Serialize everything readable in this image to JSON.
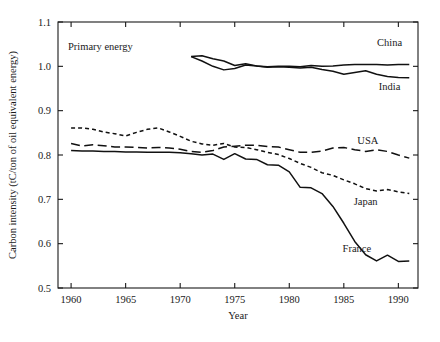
{
  "chart_data": {
    "type": "line",
    "title": "",
    "annotation": "Primary energy",
    "xlabel": "Year",
    "ylabel": "Carbon intensity (tC/ton of oil equivalent energy)",
    "xlim": [
      1958.8,
      1991.8
    ],
    "ylim": [
      0.5,
      1.1
    ],
    "xticks": [
      1960,
      1965,
      1970,
      1975,
      1980,
      1985,
      1990
    ],
    "xtick_labels": [
      "1960",
      "1965",
      "1970",
      "1975",
      "1980",
      "1985",
      "1990"
    ],
    "yticks": [
      0.5,
      0.6,
      0.7,
      0.8,
      0.9,
      1.0,
      1.1
    ],
    "ytick_labels": [
      "0.5",
      "0.6",
      "0.7",
      "0.8",
      "0.9",
      "1.0",
      "1.1"
    ],
    "grid": false,
    "legend_position": "inline-right-of-series",
    "line_color": "#111111",
    "series": [
      {
        "name": "China",
        "label": "China",
        "style": "solid",
        "dasharray": "",
        "label_x": 1989.2,
        "label_y": 1.046,
        "x": [
          1971,
          1972,
          1973,
          1974,
          1975,
          1976,
          1977,
          1978,
          1979,
          1980,
          1981,
          1982,
          1983,
          1984,
          1985,
          1986,
          1987,
          1988,
          1989,
          1990,
          1991
        ],
        "y": [
          1.022,
          1.024,
          1.017,
          1.012,
          1.002,
          1.006,
          1.001,
          0.999,
          1.0,
          1.0,
          0.999,
          1.002,
          1.0,
          1.001,
          1.003,
          1.004,
          1.004,
          1.004,
          1.003,
          1.004,
          1.004
        ]
      },
      {
        "name": "India",
        "label": "India",
        "style": "solid",
        "dasharray": "",
        "label_x": 1989.2,
        "label_y": 0.946,
        "x": [
          1971,
          1972,
          1973,
          1974,
          1975,
          1976,
          1977,
          1978,
          1979,
          1980,
          1981,
          1982,
          1983,
          1984,
          1985,
          1986,
          1987,
          1988,
          1989,
          1990,
          1991
        ],
        "y": [
          1.022,
          1.012,
          1.0,
          0.992,
          0.995,
          1.003,
          1.001,
          0.998,
          0.999,
          0.998,
          0.996,
          0.998,
          0.993,
          0.989,
          0.982,
          0.986,
          0.99,
          0.982,
          0.977,
          0.975,
          0.974
        ]
      },
      {
        "name": "USA",
        "label": "USA",
        "style": "long-dash",
        "dasharray": "9,4.5",
        "label_x": 1987.2,
        "label_y": 0.824,
        "x": [
          1960,
          1961,
          1962,
          1963,
          1964,
          1965,
          1966,
          1967,
          1968,
          1969,
          1970,
          1971,
          1972,
          1973,
          1974,
          1975,
          1976,
          1977,
          1978,
          1979,
          1980,
          1981,
          1982,
          1983,
          1984,
          1985,
          1986,
          1987,
          1988,
          1989,
          1990,
          1991
        ],
        "y": [
          0.826,
          0.82,
          0.823,
          0.821,
          0.818,
          0.818,
          0.817,
          0.816,
          0.817,
          0.816,
          0.813,
          0.808,
          0.806,
          0.81,
          0.818,
          0.82,
          0.822,
          0.822,
          0.819,
          0.818,
          0.812,
          0.806,
          0.806,
          0.809,
          0.816,
          0.817,
          0.812,
          0.808,
          0.812,
          0.808,
          0.8,
          0.793
        ]
      },
      {
        "name": "Japan",
        "label": "Japan",
        "style": "short-dash",
        "dasharray": "4,3",
        "label_x": 1987.0,
        "label_y": 0.688,
        "x": [
          1960,
          1961,
          1962,
          1963,
          1964,
          1965,
          1966,
          1967,
          1968,
          1969,
          1970,
          1971,
          1972,
          1973,
          1974,
          1975,
          1976,
          1977,
          1978,
          1979,
          1980,
          1981,
          1982,
          1983,
          1984,
          1985,
          1986,
          1987,
          1988,
          1989,
          1990,
          1991
        ],
        "y": [
          0.861,
          0.861,
          0.858,
          0.852,
          0.848,
          0.843,
          0.851,
          0.858,
          0.861,
          0.852,
          0.842,
          0.831,
          0.825,
          0.822,
          0.826,
          0.818,
          0.817,
          0.812,
          0.806,
          0.801,
          0.792,
          0.781,
          0.772,
          0.76,
          0.754,
          0.744,
          0.735,
          0.724,
          0.719,
          0.722,
          0.717,
          0.713
        ]
      },
      {
        "name": "France",
        "label": "France",
        "style": "solid",
        "dasharray": "",
        "label_x": 1986.2,
        "label_y": 0.582,
        "x": [
          1960,
          1961,
          1962,
          1963,
          1964,
          1965,
          1966,
          1967,
          1968,
          1969,
          1970,
          1971,
          1972,
          1973,
          1974,
          1975,
          1976,
          1977,
          1978,
          1979,
          1980,
          1981,
          1982,
          1983,
          1984,
          1985,
          1986,
          1987,
          1988,
          1989,
          1990,
          1991
        ],
        "y": [
          0.81,
          0.809,
          0.809,
          0.808,
          0.808,
          0.807,
          0.807,
          0.806,
          0.806,
          0.806,
          0.805,
          0.803,
          0.8,
          0.802,
          0.79,
          0.803,
          0.791,
          0.79,
          0.778,
          0.777,
          0.762,
          0.727,
          0.726,
          0.713,
          0.684,
          0.646,
          0.605,
          0.575,
          0.561,
          0.574,
          0.56,
          0.561
        ]
      }
    ]
  },
  "axis": {
    "xlabel": "Year",
    "ylabel": "Carbon intensity (tC/ton of oil equivalent energy)"
  }
}
